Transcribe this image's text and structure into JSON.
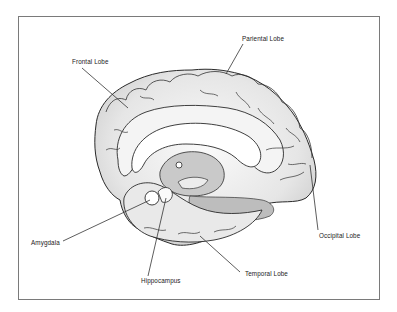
{
  "diagram": {
    "labels": {
      "frontal": "Frontal Lobe",
      "parietal": "Pariental Lobe",
      "occipital": "Occipital Lobe",
      "temporal": "Temporal Lobe",
      "amygdala": "Amygdala",
      "hippocampus": "Hippocampus"
    },
    "colors": {
      "frame": "#7a7a7a",
      "outline": "#2a2a2a",
      "fill_light": "#f2f2f2",
      "fill_mid": "#d6d6d6",
      "fill_dark": "#b8b8b8"
    }
  }
}
